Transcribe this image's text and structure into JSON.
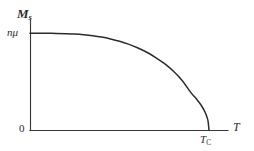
{
  "figure": {
    "kind": "line-plot",
    "background_color": "#ffffff",
    "ink_color": "#2b2b2b",
    "axis_color": "#3a3a3a"
  },
  "labels": {
    "y_axis_symbol": "M",
    "y_axis_subscript": "s",
    "y_tick_value": "nμ",
    "origin": "0",
    "curie_symbol": "T",
    "curie_subscript": "C",
    "x_axis_symbol": "T"
  },
  "chart_data": {
    "type": "line",
    "title": "",
    "subtitle": "",
    "xlabel": "T",
    "ylabel": "M_s",
    "grid": false,
    "legend": "none",
    "annotations": [
      {
        "text": "nμ",
        "axis": "y",
        "at": 1.0,
        "role": "saturation-magnetization-tick"
      },
      {
        "text": "0",
        "axis": "origin",
        "at": 0.0,
        "role": "origin-label"
      },
      {
        "text": "T_C",
        "axis": "x",
        "at": 1.0,
        "role": "curie-temperature-tick"
      }
    ],
    "xlim": [
      0,
      1.1
    ],
    "ylim": [
      0,
      1.18
    ],
    "x_tick_labels": [
      "0",
      "T_C"
    ],
    "y_tick_labels": [
      "0",
      "nμ"
    ],
    "series": [
      {
        "name": "spontaneous magnetization",
        "x": [
          0.0,
          0.05,
          0.1,
          0.15,
          0.2,
          0.25,
          0.3,
          0.35,
          0.4,
          0.45,
          0.5,
          0.55,
          0.6,
          0.65,
          0.7,
          0.75,
          0.8,
          0.85,
          0.9,
          0.93,
          0.96,
          0.98,
          0.99,
          0.995,
          1.0
        ],
        "y": [
          1.0,
          1.0,
          0.999,
          0.998,
          0.995,
          0.991,
          0.984,
          0.974,
          0.96,
          0.941,
          0.917,
          0.887,
          0.85,
          0.806,
          0.752,
          0.688,
          0.61,
          0.513,
          0.385,
          0.322,
          0.247,
          0.177,
          0.127,
          0.09,
          0.0
        ]
      }
    ]
  }
}
